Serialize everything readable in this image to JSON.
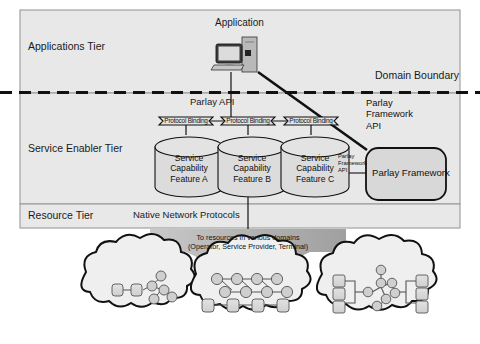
{
  "diagram": {
    "title_region": "Parlay layered architecture diagram",
    "tiers": [
      {
        "id": "applications",
        "label": "Applications Tier"
      },
      {
        "id": "service-enabler",
        "label": "Service Enabler Tier"
      },
      {
        "id": "resource",
        "label": "Resource Tier"
      }
    ],
    "nodes": {
      "application": {
        "label": "Application",
        "icon": "desktop-computer-icon"
      },
      "parlay_framework_box": {
        "label": "Parlay Framework"
      }
    },
    "labels": {
      "domain_boundary": "Domain Boundary",
      "parlay_api": "Parlay API",
      "native_network_protocols": "Native Network Protocols",
      "parlay_framework_api_right": "Parlay\nFramework\nAPI",
      "parlay_framework_api_right_lines": [
        "Parlay",
        "Framework",
        "API"
      ],
      "parlay_framework_api_small_lines": [
        "Parlay",
        "Framework",
        "API"
      ],
      "arrow_caption": "To resources in various domains (Operator, Service Provider, Terminal)"
    },
    "protocol_bindings": [
      {
        "id": "pb-a",
        "label": "Protocol Binding"
      },
      {
        "id": "pb-b",
        "label": "Protocol Binding"
      },
      {
        "id": "pb-c",
        "label": "Protocol Binding"
      }
    ],
    "service_capability_features": [
      {
        "id": "scf-a",
        "lines": [
          "Service",
          "Capability",
          "Feature A"
        ]
      },
      {
        "id": "scf-b",
        "lines": [
          "Service",
          "Capability",
          "Feature B"
        ]
      },
      {
        "id": "scf-c",
        "lines": [
          "Service",
          "Capability",
          "Feature C"
        ]
      }
    ],
    "clouds": [
      {
        "id": "cloud-left",
        "contents": "two cylinders linked to a small node tree"
      },
      {
        "id": "cloud-center",
        "contents": "node mesh above a row of four cylinders"
      },
      {
        "id": "cloud-right",
        "contents": "node mesh linking left and right cylinder stacks"
      }
    ],
    "colors": {
      "tier_fill": "#e8e8e8",
      "tier_stroke": "#9a9a9a",
      "shape_fill": "#d8d8d8",
      "shape_stroke": "#1a1a1a",
      "cloud_fill": "#efefef",
      "arrow_fill": "#b5b5b5",
      "node_fill": "#cfcfcf",
      "text": "#111111",
      "page_bg": "#ffffff"
    }
  }
}
